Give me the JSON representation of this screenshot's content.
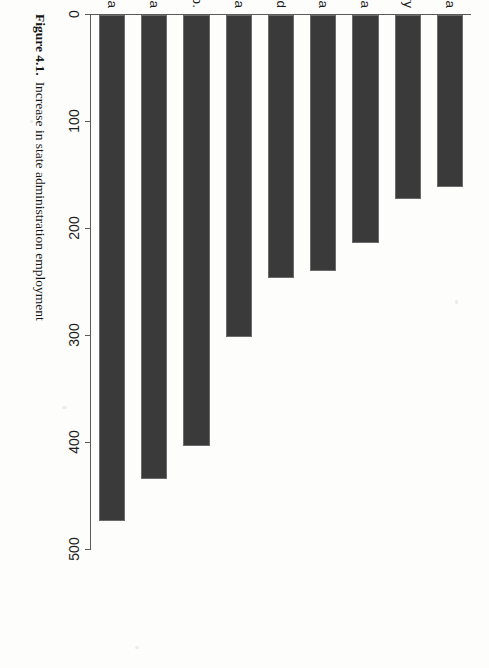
{
  "figure": {
    "caption_label": "Figure 4.1.",
    "caption_text": "Increase in state administration employment"
  },
  "chart_data": {
    "type": "bar",
    "orientation": "horizontal",
    "title": "",
    "xlabel": "",
    "ylabel": "",
    "categories": [
      "Estonia",
      "Hungary",
      "Slovenia",
      "Lithuania",
      "Poland",
      "Slovakia",
      "Czech Rep.",
      "Bulgaria",
      "Latvia"
    ],
    "values": [
      161,
      172,
      213,
      239,
      246,
      301,
      403,
      434,
      473
    ],
    "tick_labels": [
      "0",
      "100",
      "200",
      "300",
      "400",
      "500"
    ],
    "tick_values": [
      0,
      100,
      200,
      300,
      400,
      500
    ],
    "xlim": [
      0,
      500
    ],
    "grid": false,
    "legend": "none",
    "bar_color": "#3a3a3a"
  }
}
